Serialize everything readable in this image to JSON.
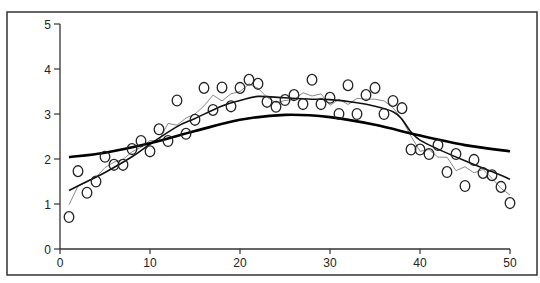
{
  "chart_data": {
    "type": "scatter",
    "title": "",
    "xlabel": "",
    "ylabel": "",
    "xlim": [
      0,
      50
    ],
    "ylim": [
      0,
      5
    ],
    "x_ticks": [
      0,
      10,
      20,
      30,
      40,
      50
    ],
    "y_ticks": [
      0,
      1,
      2,
      3,
      4,
      5
    ],
    "x_tick_labels": [
      "0",
      "10",
      "20",
      "30",
      "40",
      "50"
    ],
    "y_tick_labels": [
      "0",
      "1",
      "2",
      "3",
      "4",
      "5"
    ],
    "grid": false,
    "legend": null,
    "series": [
      {
        "name": "observations",
        "kind": "scatter",
        "marker": "open-circle",
        "color": "#222222",
        "x": [
          1,
          2,
          3,
          4,
          5,
          6,
          7,
          8,
          9,
          10,
          11,
          12,
          13,
          14,
          15,
          16,
          17,
          18,
          19,
          20,
          21,
          22,
          23,
          24,
          25,
          26,
          27,
          28,
          29,
          30,
          31,
          32,
          33,
          34,
          35,
          36,
          37,
          38,
          39,
          40,
          41,
          42,
          43,
          44,
          45,
          46,
          47,
          48,
          49,
          50
        ],
        "y": [
          0.71,
          1.73,
          1.25,
          1.5,
          2.05,
          1.87,
          1.87,
          2.22,
          2.4,
          2.17,
          2.66,
          2.4,
          3.3,
          2.56,
          2.87,
          3.58,
          3.09,
          3.59,
          3.17,
          3.58,
          3.76,
          3.67,
          3.27,
          3.16,
          3.31,
          3.42,
          3.22,
          3.76,
          3.22,
          3.36,
          3.0,
          3.64,
          3.0,
          3.42,
          3.58,
          3.0,
          3.29,
          3.13,
          2.21,
          2.21,
          2.11,
          2.31,
          1.71,
          2.11,
          1.4,
          1.98,
          1.69,
          1.64,
          1.38,
          1.02
        ]
      },
      {
        "name": "moving-average",
        "kind": "line",
        "color": "#8a8a8a",
        "width": 1,
        "x": [
          1,
          2,
          3,
          4,
          5,
          6,
          7,
          8,
          9,
          10,
          11,
          12,
          13,
          14,
          15,
          16,
          17,
          18,
          19,
          20,
          21,
          22,
          23,
          24,
          25,
          26,
          27,
          28,
          29,
          30,
          31,
          32,
          33,
          34,
          35,
          36,
          37,
          38,
          39,
          40,
          41,
          42,
          43,
          44,
          45,
          46,
          47,
          48,
          49,
          50
        ],
        "y": [
          0.98,
          1.4,
          1.49,
          1.6,
          1.81,
          1.93,
          1.99,
          2.16,
          2.26,
          2.41,
          2.41,
          2.79,
          2.75,
          2.91,
          3.0,
          3.18,
          3.42,
          3.29,
          3.45,
          3.5,
          3.67,
          3.57,
          3.37,
          3.25,
          3.3,
          3.32,
          3.47,
          3.4,
          3.45,
          3.19,
          3.33,
          3.21,
          3.35,
          3.33,
          3.33,
          3.29,
          3.14,
          2.88,
          2.51,
          2.17,
          2.21,
          2.04,
          2.04,
          1.74,
          1.83,
          1.69,
          1.77,
          1.57,
          1.35,
          1.2
        ]
      },
      {
        "name": "smooth-fit",
        "kind": "line",
        "color": "#111111",
        "width": 1.6,
        "x": [
          1,
          3,
          5,
          8,
          10,
          13,
          15,
          18,
          20,
          22,
          25,
          28,
          30,
          33,
          35,
          37,
          38,
          39,
          40,
          42,
          45,
          48,
          50
        ],
        "y": [
          1.3,
          1.5,
          1.7,
          2.05,
          2.33,
          2.72,
          2.9,
          3.18,
          3.3,
          3.39,
          3.36,
          3.33,
          3.32,
          3.25,
          3.17,
          3.05,
          2.88,
          2.6,
          2.42,
          2.22,
          1.96,
          1.72,
          1.55
        ]
      },
      {
        "name": "gaussian-fit",
        "kind": "line",
        "color": "#000000",
        "width": 2.6,
        "x": [
          1,
          5,
          10,
          15,
          20,
          25,
          30,
          35,
          40,
          45,
          50
        ],
        "y": [
          2.04,
          2.14,
          2.35,
          2.62,
          2.87,
          2.98,
          2.93,
          2.76,
          2.52,
          2.31,
          2.17
        ]
      }
    ]
  },
  "frame": {
    "border_color": "#333333",
    "background": "#ffffff"
  }
}
